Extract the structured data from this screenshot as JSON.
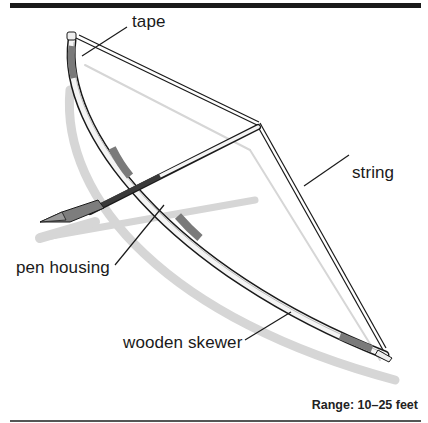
{
  "figure": {
    "labels": {
      "tape": "tape",
      "string": "string",
      "pen_housing": "pen housing",
      "wooden_skewer": "wooden skewer"
    },
    "range_note": "Range: 10–25 feet"
  },
  "colors": {
    "ink": "#1a1a1a",
    "tape_gray": "#7a7a7a",
    "shadow": "#d4d4d4",
    "string_shadow": "#cfcfcf"
  }
}
